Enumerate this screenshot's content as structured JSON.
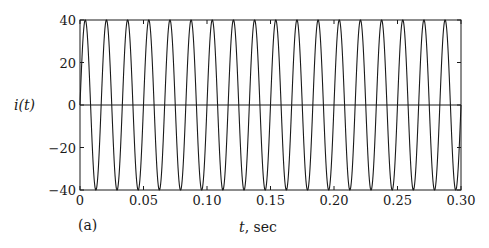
{
  "chart_data": {
    "type": "line",
    "title": "",
    "panel_label": "(a)",
    "xlabel_var": "t",
    "xlabel_unit": ", sec",
    "xlabel": "t, sec",
    "ylabel": "i(t)",
    "xlim": [
      0,
      0.3
    ],
    "ylim": [
      -40,
      40
    ],
    "xticks": [
      0,
      0.05,
      0.1,
      0.15,
      0.2,
      0.25,
      0.3
    ],
    "xtick_labels": [
      "0",
      "0.05",
      "0.10",
      "0.15",
      "0.20",
      "0.25",
      "0.30"
    ],
    "yticks": [
      -40,
      -20,
      0,
      20,
      40
    ],
    "ytick_labels": [
      "−40",
      "−20",
      "0",
      "20",
      "40"
    ],
    "grid": false,
    "legend": null,
    "zero_line": true,
    "series": [
      {
        "name": "i(t)",
        "function": "40*sin(2*pi*60*t)",
        "amplitude": 40,
        "frequency_hz": 60,
        "phase_rad": 0,
        "cycles_shown": 18,
        "sample_points": {
          "t": [
            0,
            0.00417,
            0.00833,
            0.0125,
            0.01667,
            0.05,
            0.1,
            0.15,
            0.2,
            0.25,
            0.29583,
            0.3
          ],
          "i": [
            0,
            40,
            0,
            -40,
            0,
            0,
            0,
            0,
            0,
            0,
            -40,
            0
          ]
        }
      }
    ],
    "colors": {
      "line": "#1a1a1a",
      "axes": "#1a1a1a"
    }
  }
}
